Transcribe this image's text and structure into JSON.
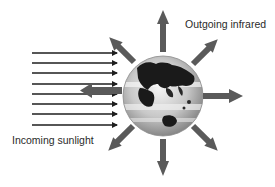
{
  "diagram": {
    "labels": {
      "outgoing": "Outgoing infrared",
      "incoming": "Incoming sunlight"
    },
    "colors": {
      "sunlight_arrow": "#1e1e1e",
      "infrared_arrow": "#5a5a5a",
      "land": "#1a1a1a",
      "ocean_light": "#e6e6e6",
      "ocean_dark": "#9a9a9a",
      "background": "#ffffff"
    },
    "incoming_arrow_count": 8,
    "outgoing_arrow_count": 8,
    "reflected_arrow_count": 1
  }
}
